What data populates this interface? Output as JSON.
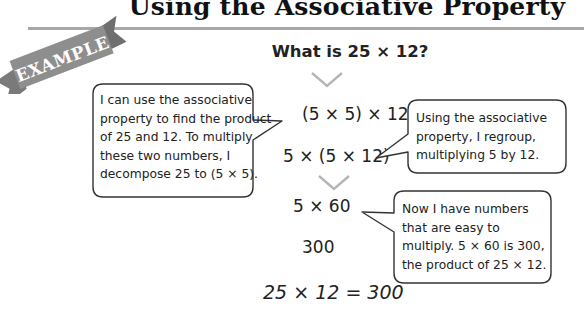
{
  "header": {
    "title": "Using the Associative Property",
    "ribbon_label": "EXAMPLE"
  },
  "question": "What is 25 × 12?",
  "steps": [
    "(5 × 5) × 12",
    "5 × (5 × 12)",
    "5 × 60",
    "300"
  ],
  "conclusion": "25 × 12 = 300",
  "callouts": [
    {
      "lines": [
        "I can use the associative",
        "property to find the product",
        "of 25 and 12. To multiply",
        "these two numbers, I",
        "decompose 25 to (5 × 5)."
      ]
    },
    {
      "lines": [
        "Using the associative",
        "property, I regroup,",
        "multiplying 5 by 12."
      ]
    },
    {
      "lines": [
        "Now I have numbers",
        "that are easy to",
        "multiply. 5 × 60 is 300,",
        "the product of 25 × 12."
      ]
    }
  ],
  "icons": {
    "arrow": "chevron-down-icon",
    "banner": "ribbon-banner"
  },
  "colors": {
    "ribbon": "#8a8a8a",
    "rule": "#a8a8a8",
    "chevron": "#b5b5b5",
    "bubble_border": "#333333"
  }
}
